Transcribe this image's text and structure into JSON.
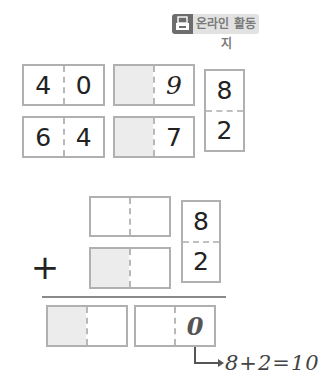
{
  "badge": {
    "icon": "printer-icon",
    "label": "온라인 활동지"
  },
  "top_section": {
    "row1": {
      "left_box": [
        "4",
        "0"
      ],
      "mid_box": [
        "",
        "9"
      ]
    },
    "row2": {
      "left_box": [
        "6",
        "4"
      ],
      "mid_box": [
        "",
        "7"
      ]
    },
    "split_box": {
      "top": "8",
      "bottom": "2"
    }
  },
  "bottom_section": {
    "addend1_box": [
      "",
      ""
    ],
    "addend2_box": [
      "",
      ""
    ],
    "split_box": {
      "top": "8",
      "bottom": "2"
    },
    "operator": "+",
    "result_box1": [
      "",
      ""
    ],
    "result_box2": [
      "",
      "0"
    ],
    "annotation": "8+2=10"
  },
  "colors": {
    "border": "#b0b0b0",
    "shaded": "#ececec",
    "badge_icon_bg": "#6d6d6d",
    "badge_text_bg": "#e2e2e2"
  }
}
